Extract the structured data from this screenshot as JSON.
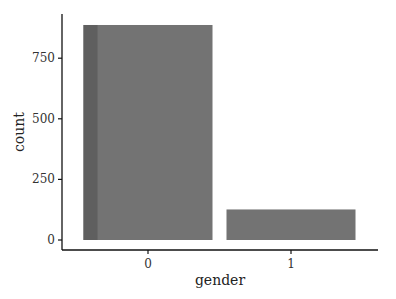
{
  "chart_data": {
    "type": "bar",
    "title": "",
    "xlabel": "gender",
    "ylabel": "count",
    "categories": [
      "0",
      "1"
    ],
    "values": [
      887,
      126
    ],
    "ylim": [
      0,
      925
    ],
    "yticks": [
      0,
      250,
      500,
      750
    ],
    "ytick_labels": [
      "0",
      "250",
      "500",
      "750"
    ],
    "grid": false,
    "legend": null,
    "colors": {
      "bar": "#737373",
      "bar_shade": "#5f5f5f",
      "axis": "#111111"
    }
  }
}
